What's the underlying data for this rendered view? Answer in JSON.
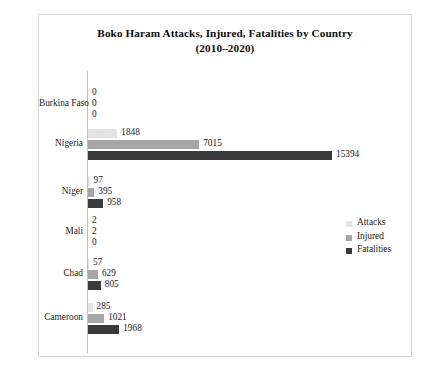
{
  "figure": {
    "title_line1": "Boko Haram Attacks, Injured, Fatalities by Country",
    "title_line2": "(2010–2020)"
  },
  "legend": {
    "position": "right-middle",
    "items": [
      {
        "label": "Attacks",
        "color": "#e3e3e3"
      },
      {
        "label": "Injured",
        "color": "#a6a6a6"
      },
      {
        "label": "Fatalities",
        "color": "#3a3a3a"
      }
    ]
  },
  "chart_data": {
    "type": "bar",
    "orientation": "horizontal",
    "title": "Boko Haram Attacks, Injured, Fatalities by Country (2010–2020)",
    "xlabel": "",
    "ylabel": "",
    "grid": false,
    "legend_position": "right-middle",
    "categories": [
      "Burkina Faso",
      "Nigeria",
      "Niger",
      "Mali",
      "Chad",
      "Cameroon"
    ],
    "series": [
      {
        "name": "Attacks",
        "color": "#e3e3e3",
        "values": [
          0,
          1848,
          97,
          2,
          57,
          285
        ]
      },
      {
        "name": "Injured",
        "color": "#a6a6a6",
        "values": [
          0,
          7015,
          395,
          2,
          629,
          1021
        ]
      },
      {
        "name": "Fatalities",
        "color": "#3a3a3a",
        "values": [
          0,
          15394,
          958,
          0,
          805,
          1968
        ]
      }
    ],
    "xlim": [
      0,
      15394
    ],
    "value_labels": [
      [
        "0",
        "0",
        "0"
      ],
      [
        "1848",
        "7015",
        "15394"
      ],
      [
        "97",
        "395",
        "958"
      ],
      [
        "2",
        "2",
        "0"
      ],
      [
        "57",
        "629",
        "805"
      ],
      [
        "285",
        "1021",
        "1968"
      ]
    ]
  }
}
